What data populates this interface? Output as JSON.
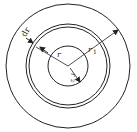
{
  "diagram": {
    "type": "concentric-circles",
    "center": {
      "x": 68,
      "y": 66
    },
    "circles": [
      {
        "name": "outer-circle",
        "r": 62
      },
      {
        "name": "ring-outer-edge",
        "r": 42
      },
      {
        "name": "ring-inner-edge",
        "r": 39
      },
      {
        "name": "inner-circle",
        "r": 20
      }
    ],
    "labels": {
      "dr": "dr",
      "r": "r",
      "r1": "r",
      "r1_sub": "1",
      "r2": "r",
      "r2_sub": "2"
    },
    "stroke_color": "#222222"
  }
}
